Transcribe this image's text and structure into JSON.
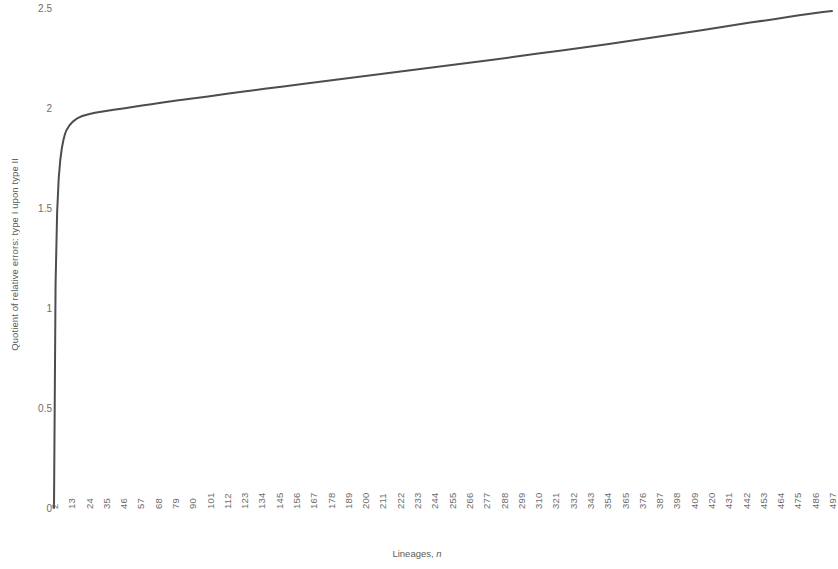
{
  "chart_data": {
    "type": "line",
    "title": "",
    "xlabel": "Lineages, n",
    "xlabel_plain": "Lineages,",
    "xlabel_italic": "n",
    "ylabel": "Quotient of relative errors: type I upon type II",
    "xlim": [
      2,
      497
    ],
    "ylim": [
      0,
      2.5
    ],
    "grid": false,
    "legend": null,
    "line_color": "#4d4d4d",
    "line_width": 2,
    "ytick_labels": [
      "2.5",
      "2",
      "1.5",
      "1",
      "0.5",
      "0"
    ],
    "ytick_values": [
      2.5,
      2,
      1.5,
      1,
      0.5,
      0
    ],
    "xtick_labels": [
      "2",
      "13",
      "24",
      "35",
      "46",
      "57",
      "68",
      "79",
      "90",
      "101",
      "112",
      "123",
      "134",
      "145",
      "156",
      "167",
      "178",
      "189",
      "200",
      "211",
      "222",
      "233",
      "244",
      "255",
      "266",
      "277",
      "288",
      "299",
      "310",
      "321",
      "332",
      "343",
      "354",
      "365",
      "376",
      "387",
      "398",
      "409",
      "420",
      "431",
      "442",
      "453",
      "464",
      "475",
      "486",
      "497"
    ],
    "xtick_values": [
      2,
      13,
      24,
      35,
      46,
      57,
      68,
      79,
      90,
      101,
      112,
      123,
      134,
      145,
      156,
      167,
      178,
      189,
      200,
      211,
      222,
      233,
      244,
      255,
      266,
      277,
      288,
      299,
      310,
      321,
      332,
      343,
      354,
      365,
      376,
      387,
      398,
      409,
      420,
      431,
      442,
      453,
      464,
      475,
      486,
      497
    ],
    "x": [
      2,
      3,
      4,
      5,
      6,
      7,
      8,
      9,
      10,
      12,
      14,
      16,
      18,
      20,
      24,
      28,
      32,
      36,
      40,
      46,
      52,
      58,
      64,
      70,
      80,
      90,
      100,
      112,
      124,
      136,
      148,
      160,
      175,
      190,
      205,
      220,
      235,
      250,
      265,
      280,
      295,
      310,
      325,
      340,
      355,
      370,
      385,
      400,
      415,
      430,
      445,
      460,
      475,
      490,
      497
    ],
    "y": [
      0.0,
      1.12,
      1.48,
      1.65,
      1.74,
      1.8,
      1.84,
      1.87,
      1.89,
      1.915,
      1.932,
      1.944,
      1.953,
      1.96,
      1.969,
      1.976,
      1.981,
      1.986,
      1.991,
      1.998,
      2.005,
      2.012,
      2.019,
      2.026,
      2.037,
      2.048,
      2.058,
      2.071,
      2.084,
      2.096,
      2.108,
      2.12,
      2.135,
      2.15,
      2.165,
      2.18,
      2.195,
      2.21,
      2.225,
      2.24,
      2.256,
      2.272,
      2.288,
      2.304,
      2.32,
      2.337,
      2.355,
      2.372,
      2.39,
      2.409,
      2.427,
      2.444,
      2.462,
      2.479,
      2.485
    ]
  }
}
